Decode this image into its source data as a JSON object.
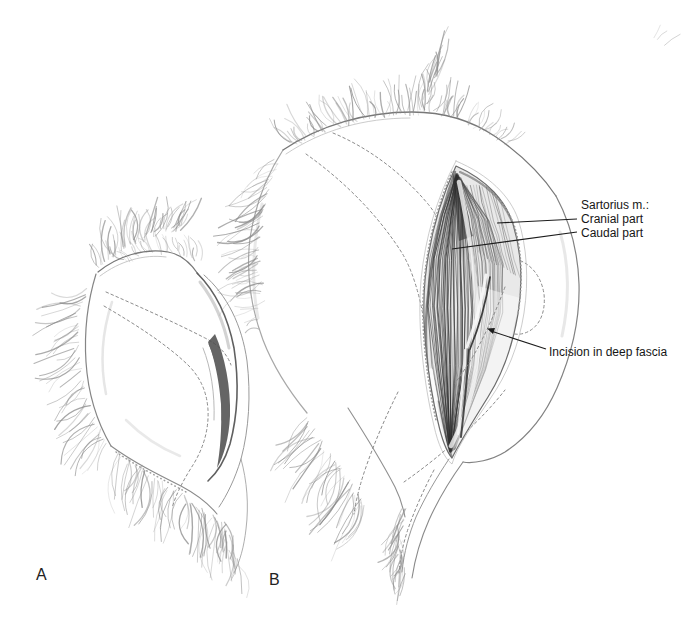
{
  "figure": {
    "type": "surgical-anatomy-illustration",
    "background_color": "#ffffff",
    "ink_color": "#161616",
    "sketch_color": "#7e7e7e"
  },
  "panel_a": {
    "letter": "A"
  },
  "panel_b": {
    "letter": "B"
  },
  "labels": {
    "sartorius_header": "Sartorius m.:",
    "sartorius_cranial": "Cranial part",
    "sartorius_caudal": "Caudal part",
    "incision_fascia": "Incision in deep fascia"
  }
}
